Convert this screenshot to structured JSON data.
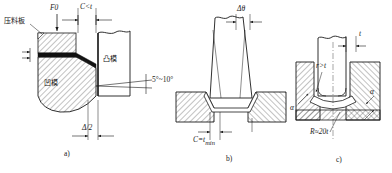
{
  "figure": {
    "title": "",
    "type": "engineering-diagram"
  },
  "panels": [
    {
      "id": "a",
      "caption": "a)",
      "labels": {
        "blank_holder": "压料板",
        "die": "凹模",
        "punch": "凸模",
        "force": "F0",
        "clearance": "C<t",
        "angle": "5°~10°",
        "offset": "Δ/2"
      }
    },
    {
      "id": "b",
      "caption": "b)",
      "labels": {
        "angle_top": "Δθ",
        "clearance_bottom": "C=t",
        "clearance_sub": "min"
      }
    },
    {
      "id": "c",
      "caption": "c)",
      "labels": {
        "thickness": "t",
        "radius_inner": "r>t",
        "angle_left": "α",
        "angle_right": "α",
        "radius_bottom": "R≈20t"
      }
    }
  ],
  "colors": {
    "line": "#1a1a1a",
    "hatch": "#333333",
    "fill_solid": "#111111",
    "background": "#ffffff"
  }
}
